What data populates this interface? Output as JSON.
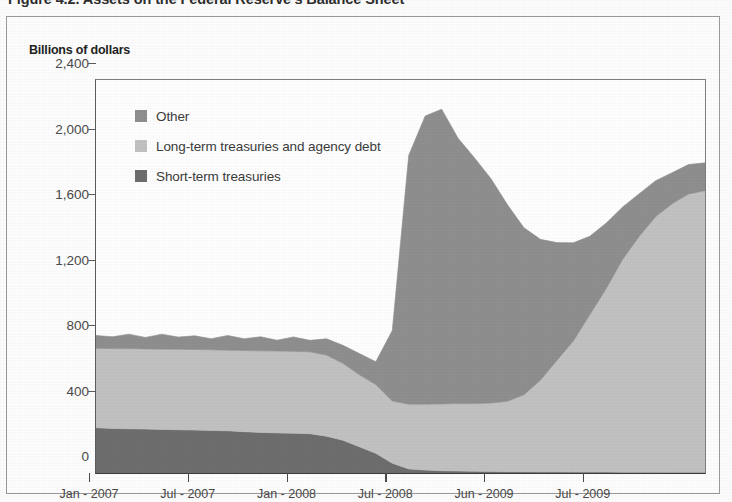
{
  "figure": {
    "title": "Figure 4.2. Assets on the Federal Reserve's Balance Sheet",
    "axis_title": "Billions of dollars"
  },
  "legend": {
    "position": "inside-top-left",
    "items": [
      {
        "label": "Other",
        "color": "#8f8f8f",
        "swatch_name": "legend-swatch-other"
      },
      {
        "label": "Long-term treasuries and agency debt",
        "color": "#c2c2c2",
        "swatch_name": "legend-swatch-long-term"
      },
      {
        "label": "Short-term treasuries",
        "color": "#6e6e6e",
        "swatch_name": "legend-swatch-short-term"
      }
    ]
  },
  "chart_data": {
    "type": "area",
    "stacked": true,
    "title": "Figure 4.2. Assets on the Federal Reserve's Balance Sheet",
    "xlabel": "",
    "ylabel": "Billions of dollars",
    "ylim": [
      0,
      2400
    ],
    "yticks": [
      0,
      400,
      800,
      1200,
      1600,
      2000,
      2400
    ],
    "ytick_labels": [
      "0",
      "400",
      "800",
      "1,200",
      "1,600",
      "2,000",
      "2,400"
    ],
    "grid": false,
    "legend_position": "upper left inside plot",
    "xtick_labels": [
      "Jan - 2007",
      "Jul - 2007",
      "Jan - 2008",
      "Jul - 2008",
      "Jun - 2009",
      "Jul - 2009"
    ],
    "xtick_positions": [
      0,
      6,
      12,
      18,
      24,
      30
    ],
    "x": [
      0,
      1,
      2,
      3,
      4,
      5,
      6,
      7,
      8,
      9,
      10,
      11,
      12,
      13,
      14,
      15,
      16,
      17,
      18,
      19,
      20,
      21,
      22,
      23,
      24,
      25,
      26,
      27,
      28,
      29,
      30,
      31,
      32,
      33,
      34,
      35,
      36,
      37
    ],
    "x_labels": [
      "Jan-2007",
      "Feb-2007",
      "Mar-2007",
      "Apr-2007",
      "May-2007",
      "Jun-2007",
      "Jul-2007",
      "Aug-2007",
      "Sep-2007",
      "Oct-2007",
      "Nov-2007",
      "Dec-2007",
      "Jan-2008",
      "Feb-2008",
      "Mar-2008",
      "Apr-2008",
      "May-2008",
      "Jun-2008",
      "Jul-2008",
      "Aug-2008",
      "Sep-2008",
      "Oct-2008",
      "Nov-2008",
      "Dec-2008",
      "Jan-2009",
      "Feb-2009",
      "Mar-2009",
      "Apr-2009",
      "May-2009",
      "Jun-2009",
      "Jul-2009",
      "Aug-2009",
      "Sep-2009",
      "Oct-2009",
      "Nov-2009",
      "Dec-2009",
      "Jan-2010",
      "Feb-2010"
    ],
    "series": [
      {
        "name": "Short-term treasuries",
        "color": "#6e6e6e",
        "values": [
          277,
          272,
          270,
          268,
          266,
          264,
          262,
          260,
          258,
          252,
          248,
          245,
          243,
          240,
          225,
          200,
          160,
          120,
          60,
          25,
          18,
          14,
          12,
          10,
          9,
          8,
          8,
          7,
          7,
          6,
          6,
          6,
          5,
          5,
          5,
          4,
          4,
          4
        ]
      },
      {
        "name": "Long-term treasuries and agency debt",
        "color": "#c2c2c2",
        "values": [
          485,
          488,
          490,
          490,
          490,
          492,
          492,
          492,
          492,
          496,
          498,
          500,
          500,
          500,
          495,
          470,
          440,
          420,
          380,
          395,
          402,
          408,
          412,
          414,
          418,
          430,
          470,
          560,
          680,
          800,
          960,
          1120,
          1300,
          1440,
          1560,
          1640,
          1700,
          1720
        ]
      },
      {
        "name": "Other",
        "color": "#8f8f8f",
        "values": [
          78,
          72,
          88,
          70,
          92,
          74,
          84,
          68,
          90,
          72,
          86,
          66,
          88,
          70,
          100,
          110,
          130,
          140,
          430,
          1520,
          1760,
          1800,
          1620,
          1500,
          1370,
          1200,
          1020,
          860,
          720,
          600,
          480,
          400,
          320,
          260,
          220,
          190,
          180,
          170
        ]
      }
    ],
    "totals": [
      840,
      832,
      848,
      828,
      848,
      830,
      838,
      820,
      840,
      820,
      832,
      811,
      831,
      810,
      820,
      780,
      730,
      680,
      870,
      1940,
      2180,
      2222,
      2044,
      1924,
      1797,
      1638,
      1498,
      1427,
      1407,
      1406,
      1446,
      1526,
      1625,
      1705,
      1785,
      1834,
      1884,
      1894
    ],
    "annotations": [
      {
        "text": "peak total assets ~2,220 (Oct 2008)",
        "x": 21,
        "y": 2222
      },
      {
        "text": "dip ~1,930 (Nov 2008)",
        "x": 23,
        "y": 1924
      }
    ]
  }
}
